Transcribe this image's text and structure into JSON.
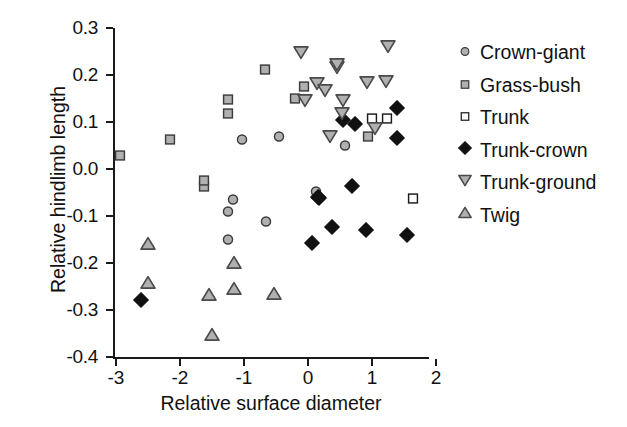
{
  "chart_data": {
    "type": "scatter",
    "title": "",
    "xlabel": "Relative surface diameter",
    "ylabel": "Relative hindlimb length",
    "xlim": [
      -3.2,
      2.0
    ],
    "ylim": [
      -0.4,
      0.3
    ],
    "xticks": [
      "-3",
      "-2",
      "-1",
      "0",
      "1",
      "2"
    ],
    "xtick_values": [
      -3,
      -2,
      -1,
      0,
      1,
      2
    ],
    "yticks": [
      "0.3",
      "0.2",
      "0.1",
      "0.0",
      "-0.1",
      "-0.2",
      "-0.3",
      "-0.4"
    ],
    "ytick_values": [
      0.3,
      0.2,
      0.1,
      0.0,
      -0.1,
      -0.2,
      -0.3,
      -0.4
    ],
    "grid": false,
    "legend_position": "right",
    "series": [
      {
        "name": "Crown-giant",
        "marker": "circle",
        "fill": "#b0b0b0",
        "stroke": "#3a3a3a",
        "points": [
          [
            -1.03,
            0.06
          ],
          [
            -0.45,
            0.066
          ],
          [
            -1.25,
            -0.094
          ],
          [
            -1.25,
            -0.153
          ],
          [
            -0.66,
            -0.115
          ],
          [
            -1.17,
            -0.068
          ],
          [
            0.13,
            -0.051
          ],
          [
            0.58,
            0.047
          ]
        ]
      },
      {
        "name": "Grass-bush",
        "marker": "square-filled",
        "fill": "#b0b0b0",
        "stroke": "#3a3a3a",
        "points": [
          [
            -2.94,
            0.026
          ],
          [
            -2.16,
            0.06
          ],
          [
            -1.25,
            0.145
          ],
          [
            -1.25,
            0.115
          ],
          [
            -0.67,
            0.209
          ],
          [
            -1.63,
            -0.04
          ],
          [
            -0.06,
            0.172
          ],
          [
            -0.2,
            0.147
          ],
          [
            0.94,
            0.066
          ],
          [
            -1.63,
            -0.028
          ]
        ]
      },
      {
        "name": "Trunk",
        "marker": "square-open",
        "fill": "#ffffff",
        "stroke": "#1a1a1a",
        "points": [
          [
            1.0,
            0.104
          ],
          [
            1.23,
            0.104
          ],
          [
            1.64,
            -0.066
          ]
        ]
      },
      {
        "name": "Trunk-crown",
        "marker": "diamond-filled",
        "fill": "#111111",
        "stroke": "#111111",
        "points": [
          [
            -2.61,
            -0.283
          ],
          [
            0.55,
            0.1
          ],
          [
            0.73,
            0.091
          ],
          [
            1.39,
            0.126
          ],
          [
            1.39,
            0.062
          ],
          [
            0.16,
            -0.064
          ],
          [
            0.69,
            -0.04
          ],
          [
            0.38,
            -0.128
          ],
          [
            0.06,
            -0.162
          ],
          [
            0.91,
            -0.134
          ],
          [
            1.55,
            -0.145
          ],
          [
            0.17,
            -0.066
          ]
        ]
      },
      {
        "name": "Trunk-ground",
        "marker": "triangle-down",
        "fill": "#b0b0b0",
        "stroke": "#4a4a4a",
        "points": [
          [
            -0.11,
            0.245
          ],
          [
            0.45,
            0.213
          ],
          [
            0.45,
            0.219
          ],
          [
            0.14,
            0.179
          ],
          [
            0.27,
            0.164
          ],
          [
            1.25,
            0.258
          ],
          [
            0.92,
            0.181
          ],
          [
            1.22,
            0.183
          ],
          [
            0.53,
            0.115
          ],
          [
            0.55,
            0.143
          ],
          [
            1.05,
            0.083
          ],
          [
            0.34,
            0.066
          ],
          [
            -0.05,
            0.143
          ]
        ]
      },
      {
        "name": "Twig",
        "marker": "triangle-up",
        "fill": "#b0b0b0",
        "stroke": "#4a4a4a",
        "points": [
          [
            -2.5,
            -0.164
          ],
          [
            -1.16,
            -0.204
          ],
          [
            -2.5,
            -0.247
          ],
          [
            -1.16,
            -0.26
          ],
          [
            -1.55,
            -0.272
          ],
          [
            -0.53,
            -0.27
          ],
          [
            -1.5,
            -0.357
          ]
        ]
      }
    ]
  },
  "legend": {
    "items": [
      {
        "label": "Crown-giant",
        "marker": "circle"
      },
      {
        "label": "Grass-bush",
        "marker": "square-filled"
      },
      {
        "label": "Trunk",
        "marker": "square-open"
      },
      {
        "label": "Trunk-crown",
        "marker": "diamond-filled"
      },
      {
        "label": "Trunk-ground",
        "marker": "triangle-down"
      },
      {
        "label": "Twig",
        "marker": "triangle-up"
      }
    ]
  }
}
